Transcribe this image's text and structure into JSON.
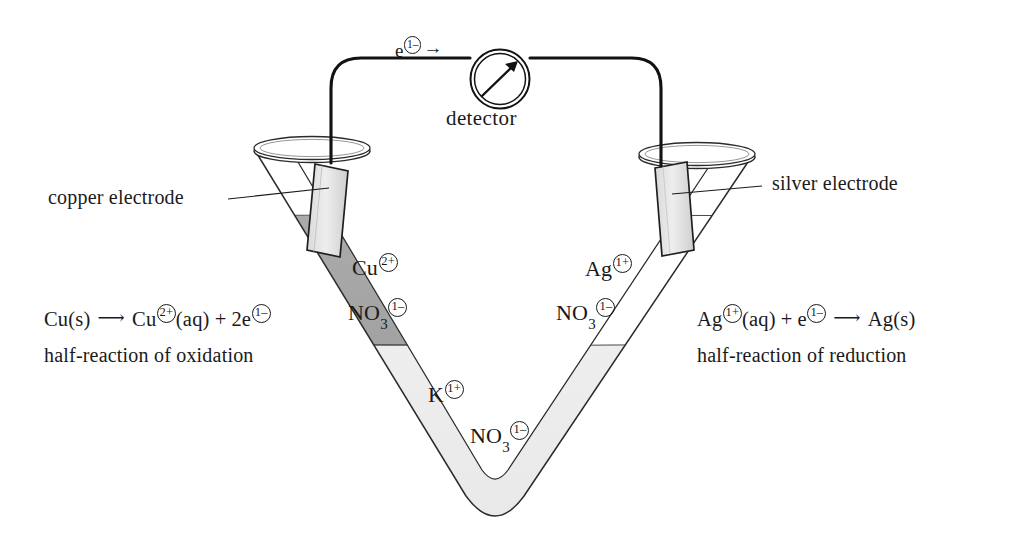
{
  "figure": {
    "background_color": "#ffffff",
    "ink_color": "#1a1a1a"
  },
  "circuit": {
    "detector_label": "detector",
    "electron_label_symbol": "e",
    "electron_label_charge": "1–",
    "electron_flow_arrow": "→",
    "meter_needle": "needle-arrow"
  },
  "electrodes": [
    {
      "id": "copper",
      "label": "copper electrode",
      "fill_color": "#e6e6e6"
    },
    {
      "id": "silver",
      "label": "silver electrode",
      "fill_color": "#ededed"
    }
  ],
  "solutions": {
    "left": {
      "name": "copper(II) nitrate",
      "fill_color": "#a8a8a8",
      "ions": [
        {
          "symbol": "Cu",
          "charge": "2+",
          "subscript": ""
        },
        {
          "symbol": "NO",
          "charge": "1–",
          "subscript": "3"
        }
      ]
    },
    "right": {
      "name": "silver nitrate",
      "fill_color": "#ffffff",
      "ions": [
        {
          "symbol": "Ag",
          "charge": "1+",
          "subscript": ""
        },
        {
          "symbol": "NO",
          "charge": "1–",
          "subscript": "3"
        }
      ]
    },
    "bottom": {
      "name": "potassium nitrate salt bridge",
      "fill_color": "#ededed",
      "ions": [
        {
          "symbol": "K",
          "charge": "1+",
          "subscript": ""
        },
        {
          "symbol": "NO",
          "charge": "1–",
          "subscript": "3"
        }
      ]
    }
  },
  "reactions": {
    "left": {
      "equation_parts": {
        "reactant": "Cu(s)",
        "arrow": "⟶",
        "product_symbol": "Cu",
        "product_charge": "2+",
        "product_state": "(aq)",
        "plus": "+",
        "electrons_count": "2e",
        "electrons_charge": "1–"
      },
      "caption": "half-reaction of oxidation"
    },
    "right": {
      "equation_parts": {
        "reactant_symbol": "Ag",
        "reactant_charge": "1+",
        "reactant_state": "(aq)",
        "plus": "+",
        "electron": "e",
        "electron_charge": "1–",
        "arrow": "⟶",
        "product": "Ag(s)"
      },
      "caption": "half-reaction of reduction"
    }
  }
}
